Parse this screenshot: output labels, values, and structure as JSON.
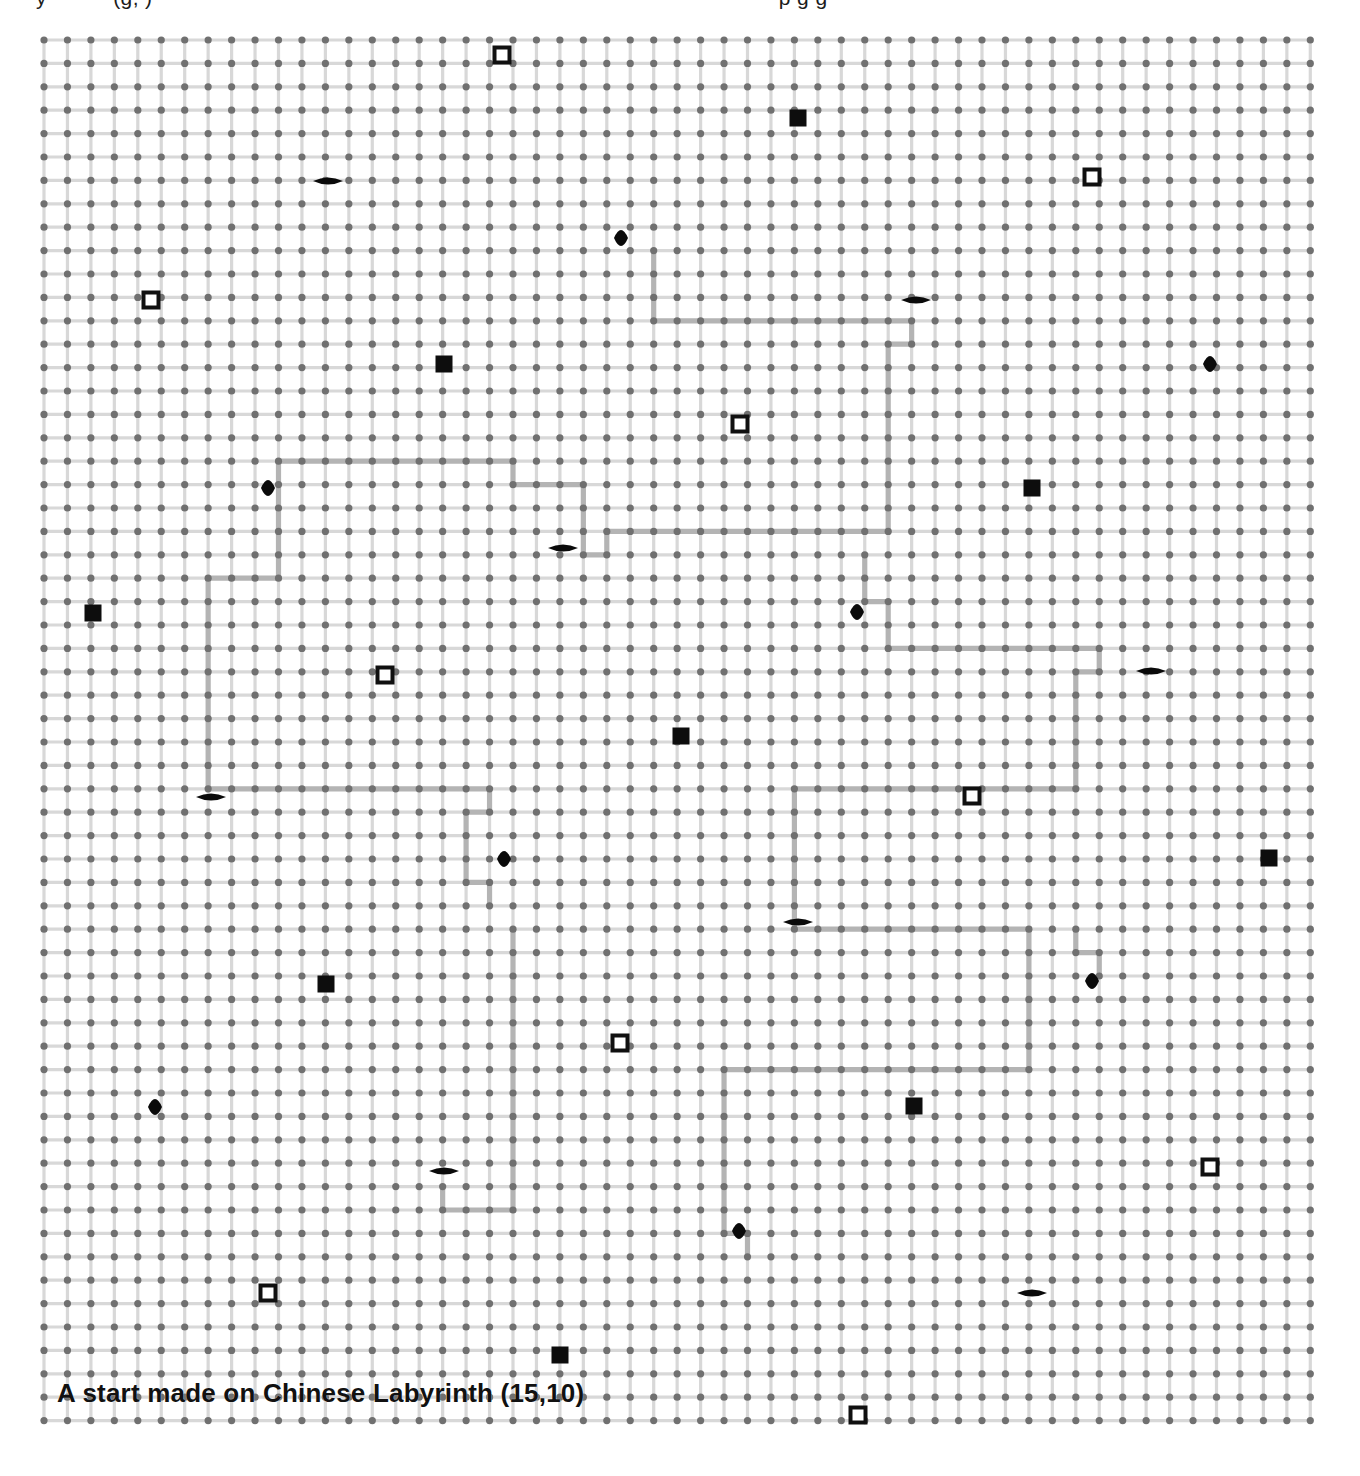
{
  "page": {
    "background_color": "#ffffff",
    "width": 1360,
    "height": 1476
  },
  "top_clipped_text": {
    "fragment_a": "y",
    "fragment_b": "(g, )",
    "fragment_c": "p g g"
  },
  "caption": {
    "text": "A start made on Chinese Labyrinth (15,10)"
  },
  "board": {
    "title": "Chinese Labyrinth",
    "coordinates_label": "(15,10)",
    "grid": {
      "origin_x": 11,
      "origin_y": 11,
      "spacing_x": 23.45,
      "spacing_y": 23.4,
      "cols": 55,
      "rows": 60,
      "dot_color": "#707070",
      "dot_radius": 3.6,
      "line_color": "#d8d8d8",
      "line_width": 3.2
    },
    "path": {
      "color": "#b4b4b4",
      "width": 5.2,
      "polylines": [
        [
          [
            26,
            9
          ],
          [
            26,
            12
          ],
          [
            37,
            12
          ],
          [
            37,
            13
          ]
        ],
        [
          [
            37,
            13
          ],
          [
            36,
            13
          ],
          [
            36,
            21
          ],
          [
            24,
            21
          ],
          [
            24,
            22
          ],
          [
            23,
            22
          ],
          [
            23,
            19
          ],
          [
            20,
            19
          ],
          [
            20,
            18
          ],
          [
            10,
            18
          ],
          [
            10,
            23
          ],
          [
            7,
            23
          ],
          [
            7,
            32
          ],
          [
            19,
            32
          ],
          [
            19,
            33
          ],
          [
            18,
            33
          ],
          [
            18,
            36
          ],
          [
            19,
            36
          ],
          [
            19,
            37
          ]
        ],
        [
          [
            35,
            22
          ],
          [
            35,
            24
          ],
          [
            36,
            24
          ],
          [
            36,
            26
          ],
          [
            45,
            26
          ],
          [
            45,
            27
          ],
          [
            44,
            27
          ],
          [
            44,
            32
          ],
          [
            32,
            32
          ],
          [
            32,
            38
          ],
          [
            42,
            38
          ],
          [
            42,
            44
          ],
          [
            29,
            44
          ],
          [
            29,
            51
          ],
          [
            30,
            51
          ],
          [
            30,
            52
          ]
        ],
        [
          [
            44,
            38
          ],
          [
            44,
            39
          ],
          [
            45,
            39
          ],
          [
            45,
            40
          ]
        ],
        [
          [
            20,
            38
          ],
          [
            20,
            50
          ],
          [
            17,
            50
          ],
          [
            17,
            49
          ]
        ]
      ]
    },
    "markers": {
      "open_square": {
        "shape": "open-square",
        "fill": "#ffffff",
        "stroke": "#101010",
        "size": 15,
        "stroke_width": 4,
        "positions": [
          [
            502,
            55
          ],
          [
            1092,
            177
          ],
          [
            151,
            300
          ],
          [
            740,
            424
          ],
          [
            385,
            675
          ],
          [
            972,
            796
          ],
          [
            620,
            1043
          ],
          [
            1210,
            1167
          ],
          [
            268,
            1293
          ],
          [
            858,
            1415
          ]
        ]
      },
      "filled_square": {
        "shape": "filled-square",
        "fill": "#0d0d0d",
        "size": 17,
        "positions": [
          [
            798,
            118
          ],
          [
            444,
            364
          ],
          [
            1032,
            488
          ],
          [
            93,
            613
          ],
          [
            681,
            736
          ],
          [
            1269,
            858
          ],
          [
            326,
            984
          ],
          [
            914,
            1106
          ],
          [
            560,
            1355
          ]
        ]
      },
      "lens_horizontal": {
        "shape": "lens-horizontal",
        "fill": "#0a0a0a",
        "rx": 15,
        "ry": 7,
        "positions": [
          [
            328,
            181
          ],
          [
            916,
            300
          ],
          [
            563,
            548
          ],
          [
            1151,
            671
          ],
          [
            211,
            797
          ],
          [
            798,
            922
          ],
          [
            444,
            1171
          ],
          [
            1032,
            1293
          ]
        ]
      },
      "lens_vertical": {
        "shape": "lens-vertical",
        "fill": "#0a0a0a",
        "rx": 7,
        "ry": 16,
        "positions": [
          [
            621,
            238
          ],
          [
            1210,
            364
          ],
          [
            268,
            488
          ],
          [
            857,
            612
          ],
          [
            504,
            859
          ],
          [
            1092,
            981
          ],
          [
            155,
            1107
          ],
          [
            739,
            1231
          ]
        ]
      }
    }
  }
}
